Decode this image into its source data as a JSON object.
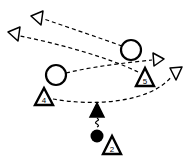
{
  "diagram": {
    "type": "sports-play",
    "colors": {
      "stroke": "#000000",
      "background": "#ffffff"
    },
    "players": [
      {
        "id": "offense-circle-top",
        "shape": "circle",
        "cx": 131,
        "cy": 50
      },
      {
        "id": "offense-circle-left",
        "shape": "circle",
        "cx": 56,
        "cy": 75
      },
      {
        "id": "player-5",
        "shape": "triangle",
        "label": "5",
        "cx": 145,
        "cy": 78
      },
      {
        "id": "player-4",
        "shape": "triangle",
        "label": "4",
        "cx": 44,
        "cy": 98
      },
      {
        "id": "player-2",
        "shape": "triangle",
        "label": "2",
        "cx": 112,
        "cy": 146
      },
      {
        "id": "ball-handler",
        "shape": "filled-circle",
        "cx": 97,
        "cy": 136
      },
      {
        "id": "dribble-end",
        "shape": "filled-triangle",
        "cx": 97,
        "cy": 110
      }
    ],
    "labels": {
      "p5": "5",
      "p4": "4",
      "p2": "2"
    }
  }
}
